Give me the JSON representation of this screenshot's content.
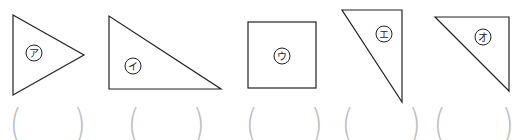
{
  "shapes": [
    {
      "id": "a",
      "label": "ア",
      "type": "triangle"
    },
    {
      "id": "i",
      "label": "イ",
      "type": "right-triangle"
    },
    {
      "id": "u",
      "label": "ウ",
      "type": "square"
    },
    {
      "id": "e",
      "label": "エ",
      "type": "right-triangle"
    },
    {
      "id": "o",
      "label": "オ",
      "type": "right-triangle"
    }
  ],
  "answer_brackets": [
    {
      "open": "(",
      "close": ")"
    },
    {
      "open": "(",
      "close": ")"
    },
    {
      "open": "(",
      "close": ")"
    },
    {
      "open": "(",
      "close": ")"
    },
    {
      "open": "(",
      "close": ")"
    }
  ],
  "colors": {
    "stroke": "#222222",
    "bracket": "#bdbdbd"
  }
}
